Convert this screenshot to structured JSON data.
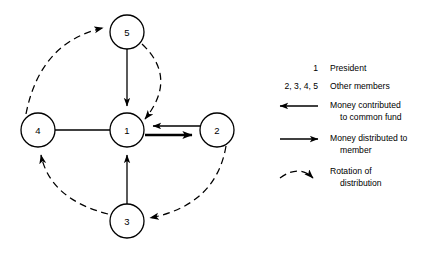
{
  "figure": {
    "background_color": "#ffffff",
    "ink_color": "#000000"
  },
  "diagram": {
    "nodes": [
      {
        "id": "1",
        "label": "1",
        "role": "President",
        "cx": 127,
        "cy": 130,
        "r": 17
      },
      {
        "id": "2",
        "label": "2",
        "role": "Other member",
        "cx": 217,
        "cy": 130,
        "r": 17
      },
      {
        "id": "3",
        "label": "3",
        "role": "Other member",
        "cx": 127,
        "cy": 221,
        "r": 17
      },
      {
        "id": "4",
        "label": "4",
        "role": "Other member",
        "cx": 38,
        "cy": 130,
        "r": 17
      },
      {
        "id": "5",
        "label": "5",
        "role": "Other member",
        "cx": 127,
        "cy": 32,
        "r": 17
      }
    ],
    "contribution_edges": [
      {
        "from": "5",
        "to": "1",
        "style": "solid-thin",
        "meaning": "Money contributed to common fund"
      },
      {
        "from": "3",
        "to": "1",
        "style": "solid-thin",
        "meaning": "Money contributed to common fund"
      },
      {
        "from": "4",
        "to": "1",
        "style": "solid-thin",
        "meaning": "Money contributed to common fund"
      },
      {
        "from": "2",
        "to": "1",
        "style": "solid-thin",
        "meaning": "Money contributed to common fund"
      }
    ],
    "distribution_edges": [
      {
        "from": "1",
        "to": "2",
        "style": "solid-thick",
        "meaning": "Money distributed to member"
      }
    ],
    "rotation_edges": [
      {
        "from": "2",
        "to": "3",
        "style": "dashed",
        "meaning": "Rotation of distribution"
      },
      {
        "from": "3",
        "to": "4",
        "style": "dashed",
        "meaning": "Rotation of distribution"
      },
      {
        "from": "4",
        "to": "5",
        "style": "dashed",
        "meaning": "Rotation of distribution"
      },
      {
        "from": "5",
        "to": "1",
        "style": "dashed",
        "meaning": "Rotation of distribution"
      }
    ]
  },
  "legend": {
    "rows": [
      {
        "key": "1",
        "desc_line1": "President",
        "desc_line2": ""
      },
      {
        "key": "2, 3, 4, 5",
        "desc_line1": "Other members",
        "desc_line2": ""
      },
      {
        "key": "arrow-left-icon",
        "desc_line1": "Money contributed",
        "desc_line2": "to common fund"
      },
      {
        "key": "arrow-right-icon",
        "desc_line1": "Money distributed to",
        "desc_line2": "member"
      },
      {
        "key": "dashed-curve-arrow-icon",
        "desc_line1": "Rotation of",
        "desc_line2": "distribution"
      }
    ]
  }
}
